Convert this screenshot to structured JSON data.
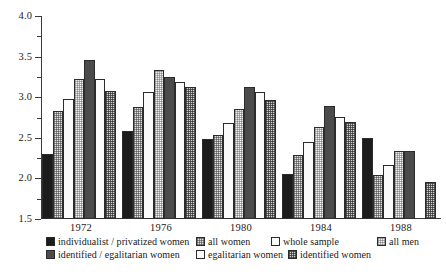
{
  "chart_data": {
    "type": "bar",
    "title": "",
    "subtitle": "",
    "xlabel": "",
    "ylabel": "",
    "grid": false,
    "legend_position": "bottom",
    "categories": [
      "1972",
      "1976",
      "1980",
      "1984",
      "1988"
    ],
    "ylim": [
      1.5,
      4.0
    ],
    "y_ticks_major": [
      "4.0",
      "3.5",
      "3.0",
      "2.5",
      "2.0",
      "1.5"
    ],
    "y_tick_values_major": [
      4.0,
      3.5,
      3.0,
      2.5,
      2.0,
      1.5
    ],
    "y_tick_values_minor": [
      3.75,
      3.25,
      2.75,
      2.25,
      1.75
    ],
    "series": [
      {
        "name": "individualist / privatized women",
        "fill": "fill-black",
        "swatch_name": "legend-swatch-individualist-privatized-women",
        "values": [
          2.3,
          2.58,
          2.49,
          2.06,
          2.5
        ]
      },
      {
        "name": "all women",
        "fill": "fill-dots-light",
        "swatch_name": "legend-swatch-all-women",
        "values": [
          2.83,
          2.88,
          2.53,
          2.29,
          2.04
        ]
      },
      {
        "name": "whole sample",
        "fill": "fill-white",
        "swatch_name": "legend-swatch-whole-sample",
        "values": [
          2.98,
          3.07,
          2.68,
          2.45,
          2.17
        ]
      },
      {
        "name": "all men",
        "fill": "fill-dots-pale",
        "swatch_name": "legend-swatch-all-men",
        "values": [
          3.22,
          3.34,
          2.86,
          2.63,
          2.34
        ]
      },
      {
        "name": "identified / egalitarian women",
        "fill": "fill-darkgray",
        "swatch_name": "legend-swatch-identified-egalitarian-women",
        "values": [
          3.46,
          3.25,
          3.13,
          2.89,
          2.34
        ]
      },
      {
        "name": "egalitarian women",
        "fill": "fill-white",
        "swatch_name": "legend-swatch-egalitarian-women",
        "values": [
          3.22,
          3.19,
          3.06,
          2.76,
          null
        ]
      },
      {
        "name": "identified women",
        "fill": "fill-dots-mid",
        "swatch_name": "legend-swatch-identified-women",
        "values": [
          3.08,
          3.12,
          2.97,
          2.69,
          1.95
        ]
      }
    ]
  },
  "legend": {
    "row1": [
      {
        "label": "individualist / privatized women",
        "fill": "fill-black"
      },
      {
        "label": "all women",
        "fill": "fill-dots-light"
      },
      {
        "label": "whole sample",
        "fill": "fill-white"
      },
      {
        "label": "all men",
        "fill": "fill-dots-pale"
      }
    ],
    "row2": [
      {
        "label": "identified / egalitarian women",
        "fill": "fill-darkgray"
      },
      {
        "label": "egalitarian women",
        "fill": "fill-white"
      },
      {
        "label": "identified women",
        "fill": "fill-dots-mid"
      }
    ]
  }
}
